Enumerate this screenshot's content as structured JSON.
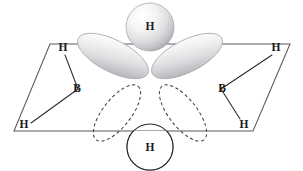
{
  "figure": {
    "molecule": "B2H6",
    "background_color": "#ffffff",
    "ink_color": "#2a2a2e",
    "plane_color": "#59595c",
    "lobe_fill_light": "#ffffff",
    "lobe_fill_mid": "#e3e3e5",
    "lobe_fill_dark": "#b5b5b9"
  },
  "labels": {
    "top_bridge_h": "H",
    "bottom_bridge_h": "H",
    "boron_left": "B",
    "boron_right": "B",
    "terminal_h_upper_left": "H",
    "terminal_h_lower_left": "H",
    "terminal_h_upper_right": "H",
    "terminal_h_lower_right": "H"
  },
  "geometry": {
    "plane_corners": {
      "top_left": [
        50,
        44
      ],
      "top_right": [
        290,
        44
      ],
      "bottom_right": [
        253,
        131
      ],
      "bottom_left": [
        14,
        131
      ]
    },
    "boron_left": [
      78,
      89
    ],
    "boron_right": [
      221,
      89
    ],
    "top_h_center": [
      150,
      27
    ],
    "top_h_radius": 24,
    "bottom_h_center": [
      150,
      147
    ],
    "bottom_h_radius": 23,
    "terminal_h_upper_left": [
      63,
      48
    ],
    "terminal_h_lower_left": [
      24,
      125
    ],
    "terminal_h_upper_right": [
      276,
      48
    ],
    "terminal_h_lower_right": [
      244,
      125
    ],
    "upper_lobe_left": {
      "cx": 113,
      "cy": 56,
      "rx": 39,
      "ry": 16,
      "rotation": 27
    },
    "upper_lobe_right": {
      "cx": 187,
      "cy": 56,
      "rx": 39,
      "ry": 16,
      "rotation": -27
    },
    "lower_lobe_left": {
      "cx": 117,
      "cy": 113,
      "rx": 34,
      "ry": 14,
      "rotation": -52
    },
    "lower_lobe_right": {
      "cx": 183,
      "cy": 113,
      "rx": 34,
      "ry": 14,
      "rotation": 52
    }
  }
}
